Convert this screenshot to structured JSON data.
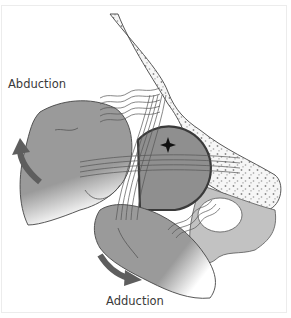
{
  "figure": {
    "labels": {
      "abduction": "Abduction",
      "adduction": "Adduction"
    },
    "elements": {
      "upper_hand": "hand performing abduction (upper left)",
      "lower_hand": "hand performing adduction (lower middle)",
      "femoral_head": "joint head with center-of-rotation marker",
      "bone": "stippled pelvic bone",
      "ligament_bands": "fibrous bands crossing the joint"
    },
    "arrows": [
      {
        "id": "abduction-arrow",
        "direction": "up-left",
        "label_ref": "abduction"
      },
      {
        "id": "adduction-arrow",
        "direction": "down-right",
        "label_ref": "adduction"
      }
    ],
    "colors": {
      "hand": "#9a9a9a",
      "hand_dark": "#8a8a8a",
      "head": "#8e8e8e",
      "bone_fill": "#f4f4f4",
      "ligament": "#e6e6e6",
      "arrow": "#5e5e5e",
      "outline": "#3a3a3a",
      "pelvis": "#bdbdbd"
    }
  }
}
